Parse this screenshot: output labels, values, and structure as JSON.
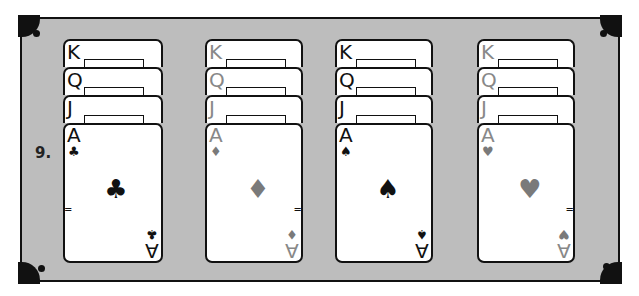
{
  "puzzle_label": "9.",
  "colors": {
    "table_felt": "#bdbdbd",
    "frame_border": "#111111",
    "black_suit": "#111111",
    "red_suit_grayscale": "#7a7a7a"
  },
  "columns": [
    {
      "suit": "clubs",
      "suit_glyph": "♣",
      "color": "black",
      "stacked_ranks": [
        "K",
        "Q",
        "J"
      ],
      "face_card": {
        "rank": "A",
        "pip": "♣"
      }
    },
    {
      "suit": "diamonds",
      "suit_glyph": "♦",
      "color": "gray",
      "stacked_ranks": [
        "K",
        "Q",
        "J"
      ],
      "face_card": {
        "rank": "A",
        "pip": "♦"
      }
    },
    {
      "suit": "spades",
      "suit_glyph": "♠",
      "color": "black",
      "stacked_ranks": [
        "K",
        "Q",
        "J"
      ],
      "face_card": {
        "rank": "A",
        "pip": "♠"
      }
    },
    {
      "suit": "hearts",
      "suit_glyph": "♥",
      "color": "gray",
      "stacked_ranks": [
        "K",
        "Q",
        "J"
      ],
      "face_card": {
        "rank": "A",
        "pip": "♥"
      }
    }
  ]
}
